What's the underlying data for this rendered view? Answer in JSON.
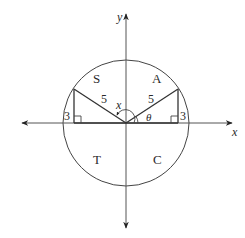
{
  "diagram": {
    "type": "unit-circle-quadrants",
    "axes": {
      "x_label": "x",
      "y_label": "y"
    },
    "quadrant_labels": {
      "q1": "A",
      "q2": "S",
      "q3": "T",
      "q4": "C"
    },
    "triangles": {
      "right": {
        "hypotenuse": "5",
        "opposite": "3",
        "angle": "θ"
      },
      "left": {
        "hypotenuse": "5",
        "opposite": "3",
        "angle": "x"
      }
    },
    "colors": {
      "stroke": "#3a3a3a",
      "background": "#ffffff"
    }
  }
}
